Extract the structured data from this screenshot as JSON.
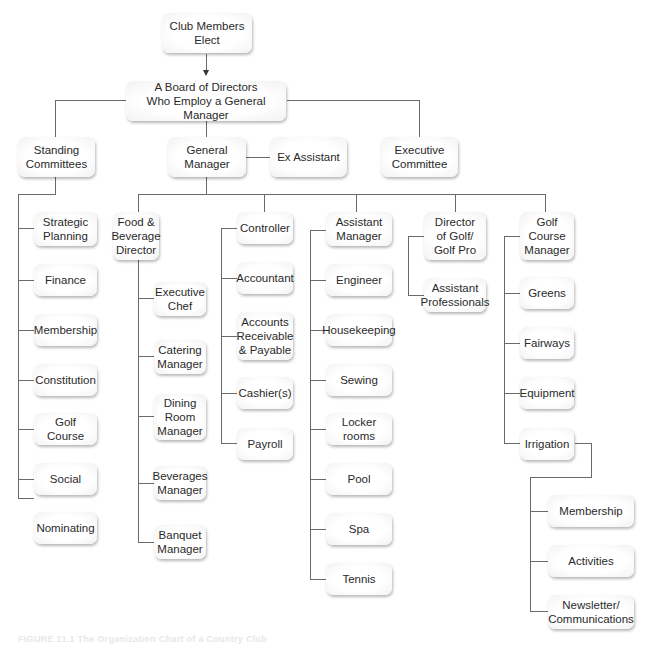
{
  "chart": {
    "caption": "FIGURE 11.1 The Organization Chart of a Country Club",
    "line_color": "#6a6a6a",
    "box_fill": "#f4f4f4",
    "nodes": {
      "club_members": "Club Members\nElect",
      "board": "A Board of Directors\nWho Employ a General Manager",
      "standing_committees": "Standing\nCommittees",
      "general_manager": "General\nManager",
      "ex_assistant": "Ex Assistant",
      "executive_committee": "Executive\nCommittee",
      "committees": [
        "Strategic\nPlanning",
        "Finance",
        "Membership",
        "Constitution",
        "Golf Course",
        "Social",
        "Nominating"
      ],
      "fb_director": "Food &\nBeverage\nDirector",
      "fb_staff": [
        "Executive\nChef",
        "Catering\nManager",
        "Dining\nRoom\nManager",
        "Beverages\nManager",
        "Banquet\nManager"
      ],
      "controller": "Controller",
      "controller_staff": [
        "Accountant",
        "Accounts\nReceivable\n& Payable",
        "Cashier(s)",
        "Payroll"
      ],
      "assistant_manager": "Assistant\nManager",
      "assistant_staff": [
        "Engineer",
        "Housekeeping",
        "Sewing",
        "Locker rooms",
        "Pool",
        "Spa",
        "Tennis"
      ],
      "director_golf": "Director\nof Golf/\nGolf Pro",
      "golf_staff": [
        "Assistant\nProfessionals"
      ],
      "course_manager": "Golf\nCourse\nManager",
      "course_staff": [
        "Greens",
        "Fairways",
        "Equipment",
        "Irrigation"
      ],
      "irrigation_sub": [
        "Membership",
        "Activities",
        "Newsletter/\nCommunications"
      ]
    }
  }
}
